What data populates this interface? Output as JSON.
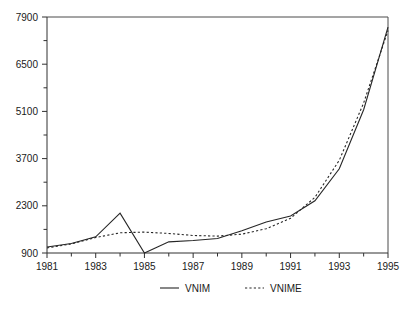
{
  "chart_data": {
    "type": "line",
    "title": "",
    "xlabel": "",
    "ylabel": "",
    "x": [
      1981,
      1982,
      1983,
      1984,
      1985,
      1986,
      1987,
      1988,
      1989,
      1990,
      1991,
      1992,
      1993,
      1994,
      1995
    ],
    "xlim": [
      1981,
      1995
    ],
    "ylim": [
      900,
      7900
    ],
    "grid": false,
    "legend_position": "bottom-center",
    "y_ticks": [
      900,
      2300,
      3700,
      5100,
      6500,
      7900
    ],
    "y_tick_labels": [
      "900",
      "2300",
      "3700",
      "5100",
      "6500",
      "7900"
    ],
    "y_minor_tick_step": 700,
    "x_ticks": [
      1981,
      1982,
      1983,
      1984,
      1985,
      1986,
      1987,
      1988,
      1989,
      1990,
      1991,
      1992,
      1993,
      1994,
      1995
    ],
    "x_tick_labels_shown": [
      "1981",
      "1983",
      "1985",
      "1987",
      "1989",
      "1991",
      "1993",
      "1995"
    ],
    "series": [
      {
        "name": "VNIM",
        "style": "solid",
        "color": "#262626",
        "values": [
          1080,
          1180,
          1380,
          2080,
          900,
          1230,
          1270,
          1330,
          1560,
          1820,
          2000,
          2450,
          3400,
          5150,
          7600
        ]
      },
      {
        "name": "VNIME",
        "style": "dotted",
        "color": "#262626",
        "values": [
          1050,
          1170,
          1360,
          1500,
          1520,
          1480,
          1420,
          1400,
          1460,
          1620,
          1930,
          2550,
          3650,
          5350,
          7500
        ]
      }
    ]
  },
  "legend": {
    "items": [
      {
        "label": "VNIM",
        "style": "solid"
      },
      {
        "label": "VNIME",
        "style": "dotted"
      }
    ]
  }
}
